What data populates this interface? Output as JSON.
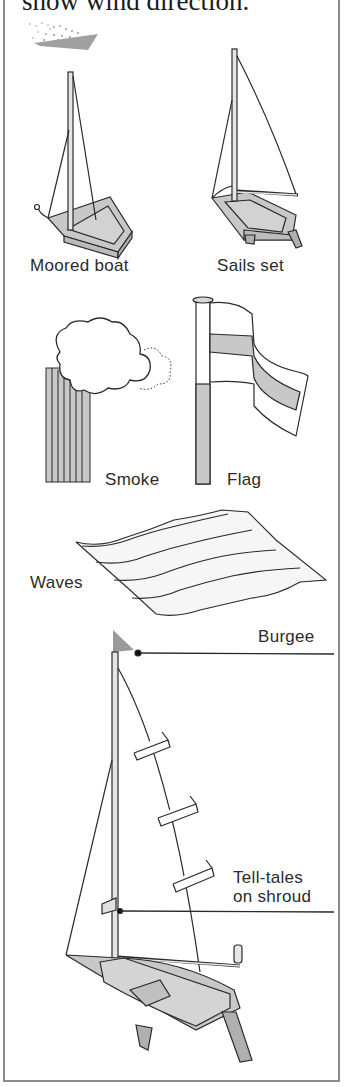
{
  "caption": {
    "text": "show wind direction."
  },
  "labels": {
    "moored_boat": "Moored boat",
    "sails_set": "Sails set",
    "smoke": "Smoke",
    "flag": "Flag",
    "waves": "Waves",
    "burgee": "Burgee",
    "tell_tales_line1": "Tell-tales",
    "tell_tales_line2": "on shroud"
  },
  "colors": {
    "line": "#2a2a2a",
    "fill_gray": "#c8c8c8",
    "border": "#8c8c8c",
    "burgee": "#9a9a9a"
  }
}
